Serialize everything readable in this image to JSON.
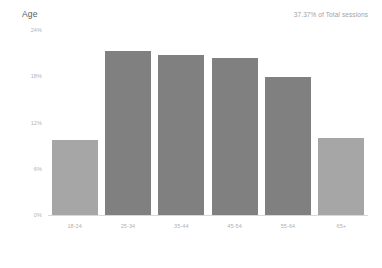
{
  "header": {
    "title": "Age",
    "sessions_note": "37.37% of Total sessions"
  },
  "chart_data": {
    "type": "bar",
    "title": "Age",
    "xlabel": "",
    "ylabel": "",
    "categories": [
      "18-24",
      "25-34",
      "35-44",
      "45-54",
      "55-64",
      "65+"
    ],
    "values": [
      9.7,
      21.3,
      20.8,
      20.4,
      17.9,
      10.0
    ],
    "ylim": [
      0,
      24
    ],
    "yticks": [
      0,
      6,
      12,
      18,
      24
    ],
    "ytick_labels": [
      "0%",
      "6%",
      "12%",
      "18%",
      "24%"
    ],
    "grid": false,
    "legend": null,
    "bar_colors": [
      "#a6a6a6",
      "#808080",
      "#808080",
      "#808080",
      "#808080",
      "#a6a6a6"
    ],
    "accent_color": "#808080",
    "muted_color": "#a6a6a6",
    "axis_color": "#d8d8d8",
    "tick_text_color": "#b3b3b3"
  }
}
